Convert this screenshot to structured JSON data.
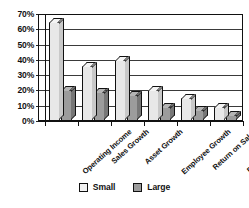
{
  "chart_data": {
    "type": "bar",
    "title": "",
    "subtitle": "",
    "xlabel": "",
    "ylabel": "",
    "ylim": [
      0,
      70
    ],
    "grid": true,
    "legend_position": "bottom-center",
    "tick_format": "percent",
    "categories": [
      "Operating Income",
      "Sales Growth",
      "Asset Growth",
      "Employee Growth",
      "Return on Sales",
      "Return on Assets"
    ],
    "ytick_labels": [
      "0%",
      "10%",
      "20%",
      "30%",
      "40%",
      "50%",
      "60%",
      "70%"
    ],
    "ytick_values": [
      0,
      10,
      20,
      30,
      40,
      50,
      60,
      70
    ],
    "series": [
      {
        "name": "Small",
        "color": "#e8e8e8",
        "values": [
          65,
          36,
          40,
          20,
          15,
          9
        ]
      },
      {
        "name": "Large",
        "color": "#9c9c9c",
        "values": [
          20,
          19,
          17,
          9,
          7,
          4
        ]
      }
    ]
  },
  "legend": {
    "items": [
      {
        "label": "Small"
      },
      {
        "label": "Large"
      }
    ]
  },
  "colors": {
    "small_series": "#e8e8e8",
    "large_series": "#9c9c9c",
    "axis": "#111111",
    "gridline": "#3a3a3a",
    "background": "#ffffff"
  }
}
